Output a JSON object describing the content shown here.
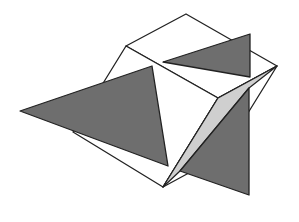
{
  "diagram": {
    "colors": {
      "background": "#ffffff",
      "stroke": "#222222",
      "triangle_fill": "#6e6e6e",
      "shade_fill": "#cfcfcf",
      "face_fill": "#ffffff"
    },
    "cube": {
      "top_face": "126,46 186,14 277,66 218,98",
      "left_face": "126,46 218,98 163,187 73,132",
      "right_face": "218,98 277,66 222,155 163,187"
    },
    "shade_wedge": "218,98 277,66 249,88 180,171 163,187",
    "triangles": [
      {
        "name": "left-triangle",
        "points": "20,111 152,66 168,166"
      },
      {
        "name": "top-triangle",
        "points": "163,62 250,34 250,77"
      },
      {
        "name": "right-triangle",
        "points": "180,171 249,88 249,195"
      }
    ]
  }
}
